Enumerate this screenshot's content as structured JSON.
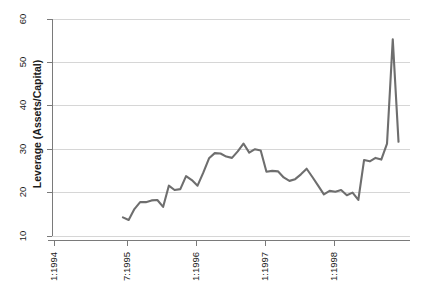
{
  "chart_data": {
    "type": "line",
    "title": "",
    "xlabel": "",
    "ylabel": "Leverage (Assets/Capital)",
    "ylim": [
      10,
      60
    ],
    "yticks": [
      10,
      20,
      30,
      40,
      50,
      60
    ],
    "ytick_labels": [
      "10",
      "20",
      "30",
      "40",
      "50",
      "60"
    ],
    "xtick_labels": [
      "1:1994",
      "7:1995",
      "1:1996",
      "1:1997",
      "1:1998"
    ],
    "xtick_values": [
      0,
      18,
      24,
      36,
      48
    ],
    "xlim": [
      0,
      62
    ],
    "grid": true,
    "legend": "none",
    "line_color": "#6e6e6e",
    "grid_color": "#d6d6d6",
    "axis_color": "#7a7a7a",
    "series": [
      {
        "name": "Leverage",
        "x": [
          12,
          13,
          14,
          15,
          16,
          17,
          18,
          19,
          20,
          21,
          22,
          23,
          24,
          25,
          26,
          27,
          28,
          29,
          30,
          31,
          32,
          33,
          34,
          35,
          36,
          37,
          38,
          39,
          40,
          41,
          42,
          43,
          44,
          45,
          46,
          47,
          48,
          49,
          50,
          51,
          52,
          53,
          54,
          55,
          56,
          57,
          58,
          59
        ],
        "values": [
          14.3,
          13.7,
          16.2,
          17.8,
          17.8,
          18.2,
          18.3,
          16.7,
          21.6,
          20.6,
          20.8,
          23.8,
          22.9,
          21.6,
          24.6,
          27.9,
          29.1,
          29.0,
          28.3,
          28.0,
          29.5,
          31.3,
          29.2,
          30.0,
          29.7,
          24.8,
          25.0,
          24.9,
          23.5,
          22.7,
          23.1,
          24.2,
          25.5,
          23.6,
          21.6,
          19.6,
          20.4,
          20.2,
          20.6,
          19.4,
          20.0,
          18.3,
          27.5,
          27.2,
          28.0,
          27.6,
          31.3,
          55.3
        ],
        "final_point": 31.7
      }
    ],
    "peak": {
      "value": 55.3,
      "label": ""
    },
    "start": {
      "value": 14.3
    },
    "end": {
      "value": 31.7
    }
  },
  "axis": {
    "y_title": "Leverage (Assets/Capital)"
  }
}
